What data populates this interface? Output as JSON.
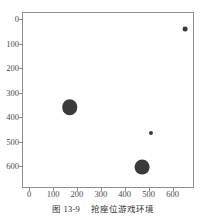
{
  "figure": {
    "caption_number": "图 13-9",
    "caption_text": "抢座位游戏环境"
  },
  "chart_data": {
    "type": "scatter",
    "title": "",
    "xlabel": "",
    "ylabel": "",
    "xlim": [
      -30,
      690
    ],
    "ylim": [
      -30,
      690
    ],
    "y_axis_inverted": true,
    "grid": false,
    "legend": "none",
    "xticks": [
      0,
      100,
      200,
      300,
      400,
      500,
      600
    ],
    "yticks": [
      0,
      100,
      200,
      300,
      400,
      500,
      600
    ],
    "xticklabels": [
      "0",
      "100",
      "200",
      "300",
      "400",
      "500",
      "600"
    ],
    "yticklabels": [
      "0",
      "100",
      "200",
      "300",
      "400",
      "500",
      "600"
    ],
    "marker_color": "#3a3a3a",
    "points": [
      {
        "x": 650,
        "y": 35,
        "size": 20
      },
      {
        "x": 165,
        "y": 355,
        "size": 65
      },
      {
        "x": 505,
        "y": 460,
        "size": 17
      },
      {
        "x": 470,
        "y": 600,
        "size": 62
      }
    ]
  }
}
